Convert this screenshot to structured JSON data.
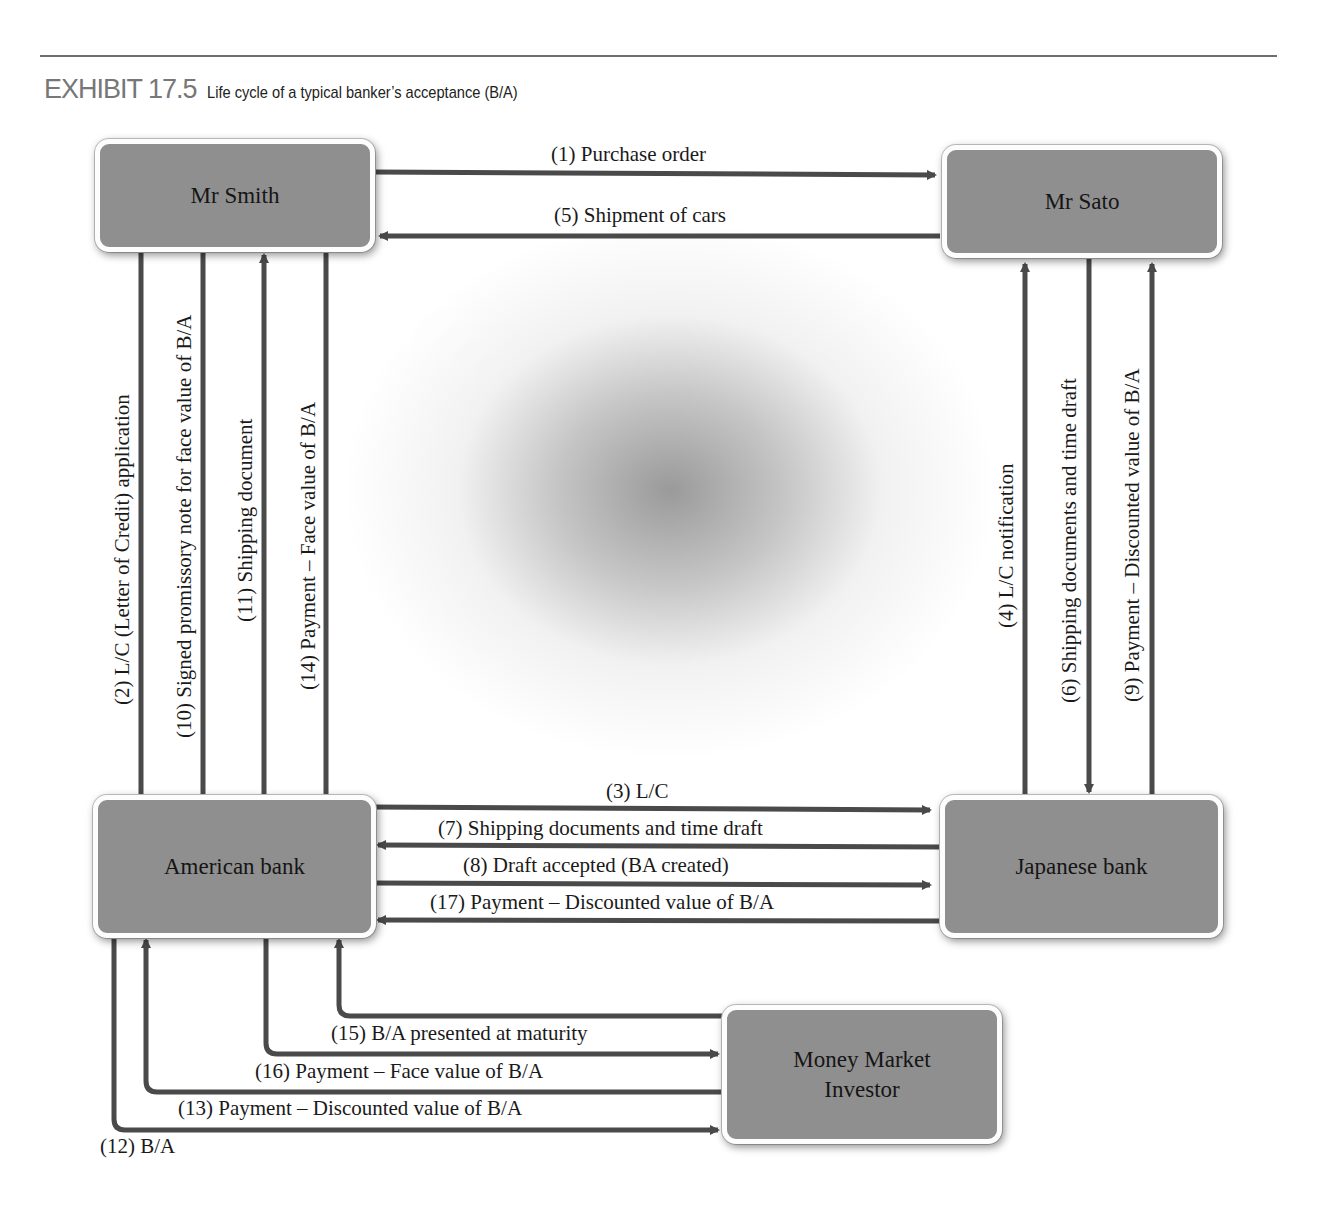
{
  "header": {
    "exhibit_number": "EXHIBIT 17.5",
    "caption": "Life cycle of a typical banker’s acceptance (B/A)"
  },
  "nodes": {
    "mr_smith": "Mr Smith",
    "mr_sato": "Mr Sato",
    "american_bank": "American bank",
    "japanese_bank": "Japanese bank",
    "money_market_investor_line1": "Money Market",
    "money_market_investor_line2": "Investor"
  },
  "flows": {
    "f1": {
      "label": "(1) Purchase order",
      "from": "Mr Smith",
      "to": "Mr Sato"
    },
    "f2": {
      "label": "(2) L/C (Letter of Credit) application",
      "from": "Mr Smith",
      "to": "American bank"
    },
    "f3": {
      "label": "(3) L/C",
      "from": "American bank",
      "to": "Japanese bank"
    },
    "f4": {
      "label": "(4) L/C notification",
      "from": "Japanese bank",
      "to": "Mr Sato"
    },
    "f5": {
      "label": "(5) Shipment of cars",
      "from": "Mr Sato",
      "to": "Mr Smith"
    },
    "f6": {
      "label": "(6) Shipping documents and time draft",
      "from": "Mr Sato",
      "to": "Japanese bank"
    },
    "f7": {
      "label": "(7) Shipping documents and time draft",
      "from": "Japanese bank",
      "to": "American bank"
    },
    "f8": {
      "label": "(8) Draft accepted (BA created)",
      "from": "American bank",
      "to": "Japanese bank"
    },
    "f9": {
      "label": "(9) Payment – Discounted value of B/A",
      "from": "Japanese bank",
      "to": "Mr Sato"
    },
    "f10": {
      "label": "(10) Signed promissory note for face value of B/A",
      "from": "Mr Smith",
      "to": "American bank"
    },
    "f11": {
      "label": "(11) Shipping document",
      "from": "American bank",
      "to": "Mr Smith"
    },
    "f12": {
      "label": "(12) B/A",
      "from": "American bank",
      "to": "Money Market Investor"
    },
    "f13": {
      "label": "(13) Payment – Discounted value of B/A",
      "from": "Money Market Investor",
      "to": "American bank"
    },
    "f14": {
      "label": "(14) Payment – Face value of B/A",
      "from": "Mr Smith",
      "to": "American bank"
    },
    "f15": {
      "label": "(15) B/A presented at maturity",
      "from": "Money Market Investor",
      "to": "American bank"
    },
    "f16": {
      "label": "(16) Payment – Face value of B/A",
      "from": "American bank",
      "to": "Money Market Investor"
    },
    "f17": {
      "label": "(17) Payment – Discounted value of B/A",
      "from": "Japanese bank",
      "to": "American bank"
    }
  },
  "colors": {
    "node_fill": "#8f8f8f",
    "arrow": "#4a4a4a",
    "rule": "#6e6e6e"
  }
}
